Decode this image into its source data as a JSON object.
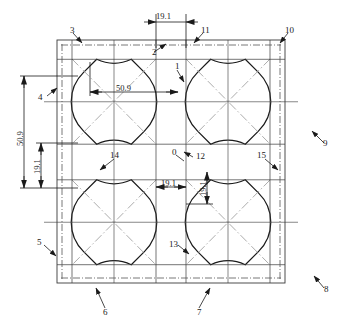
{
  "drawing": {
    "title": "Engineering unit-cell lattice drawing",
    "colors": {
      "outline": "#1a1a1a",
      "centerline": "#555555",
      "diagonal": "#9a9a9a",
      "dimension": "#1a1a1a",
      "background": "#ffffff"
    },
    "frame": {
      "x": 57,
      "y": 40,
      "width": 228,
      "height": 243
    },
    "cells": {
      "cols": 2,
      "rows": 2
    },
    "shape": {
      "name": "four-pointed-concave-star",
      "arc_sides": 4,
      "corner_segments": 4
    }
  },
  "dimensions": [
    {
      "id": "dim-top-19-1",
      "value": "19.1",
      "orientation": "horizontal",
      "x": 156,
      "y": 16
    },
    {
      "id": "dim-mid-50-9",
      "value": "50.9",
      "orientation": "horizontal",
      "x": 116,
      "y": 84
    },
    {
      "id": "dim-left-50-9",
      "value": "50.9",
      "orientation": "vertical",
      "x": 16,
      "y": 140
    },
    {
      "id": "dim-left-19-1",
      "value": "19.1",
      "orientation": "vertical",
      "x": 33,
      "y": 168
    },
    {
      "id": "dim-center-19-1",
      "value": "19.1",
      "orientation": "horizontal",
      "x": 168,
      "y": 179
    },
    {
      "id": "dim-right-19-1",
      "value": "19.1",
      "orientation": "vertical",
      "x": 203,
      "y": 208
    }
  ],
  "labels": [
    {
      "id": "label-0",
      "text": "0",
      "x": 172,
      "y": 153
    },
    {
      "id": "label-1",
      "text": "1",
      "x": 175,
      "y": 66
    },
    {
      "id": "label-2",
      "text": "2",
      "x": 156,
      "y": 52
    },
    {
      "id": "label-3",
      "text": "3",
      "x": 71,
      "y": 30
    },
    {
      "id": "label-4",
      "text": "4",
      "x": 38,
      "y": 94
    },
    {
      "id": "label-5",
      "text": "5",
      "x": 39,
      "y": 242
    },
    {
      "id": "label-6",
      "text": "6",
      "x": 102,
      "y": 312
    },
    {
      "id": "label-7",
      "text": "7",
      "x": 196,
      "y": 312
    },
    {
      "id": "label-8",
      "text": "8",
      "x": 324,
      "y": 288
    },
    {
      "id": "label-9",
      "text": "9",
      "x": 324,
      "y": 144
    },
    {
      "id": "label-10",
      "text": "10",
      "x": 285,
      "y": 30
    },
    {
      "id": "label-11",
      "text": "11",
      "x": 201,
      "y": 30
    },
    {
      "id": "label-12",
      "text": "12",
      "x": 196,
      "y": 157
    },
    {
      "id": "label-13",
      "text": "13",
      "x": 170,
      "y": 242
    },
    {
      "id": "label-14",
      "text": "14",
      "x": 111,
      "y": 155
    },
    {
      "id": "label-15",
      "text": "15",
      "x": 258,
      "y": 155
    }
  ]
}
